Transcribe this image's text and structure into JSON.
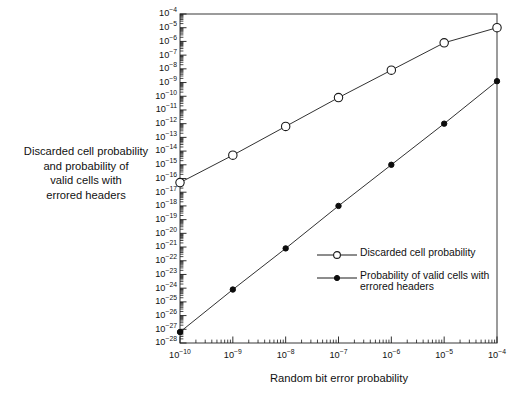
{
  "figure": {
    "background": "#ffffff",
    "frame_color": "#4a4a4a",
    "line_color": "#1a1a1a"
  },
  "y_axis": {
    "title_lines": [
      "Discarded cell probability",
      "and probability of",
      "valid cells with",
      "errored headers"
    ],
    "tick_mantissa": "10",
    "tick_exponents": [
      "-4",
      "-5",
      "-6",
      "-7",
      "-8",
      "-9",
      "-10",
      "-11",
      "-12",
      "-13",
      "-14",
      "-15",
      "-16",
      "-17",
      "-18",
      "-19",
      "-20",
      "-21",
      "-22",
      "-23",
      "-24",
      "-25",
      "-26",
      "-27",
      "-28"
    ]
  },
  "x_axis": {
    "title": "Random bit error probability",
    "tick_mantissa": "10",
    "tick_exponents": [
      "-10",
      "-9",
      "-8",
      "-7",
      "-6",
      "-5",
      "-4"
    ]
  },
  "legend": {
    "entries": [
      {
        "marker": "open-circle",
        "label": "Discarded cell probability"
      },
      {
        "marker": "filled-circle",
        "label": "Probability of valid cells with errored headers"
      }
    ]
  },
  "chart_data": {
    "type": "line",
    "title": "",
    "xlabel": "Random bit error probability",
    "ylabel": "Discarded cell probability and probability of valid cells with errored headers",
    "xscale": "log",
    "yscale": "log",
    "xlim": [
      1e-10,
      0.0001
    ],
    "ylim": [
      1e-28,
      0.0001
    ],
    "xticks": [
      1e-10,
      1e-09,
      1e-08,
      1e-07,
      1e-06,
      1e-05,
      0.0001
    ],
    "grid": false,
    "legend_position": "inside-lower-right",
    "x": [
      1e-10,
      1e-09,
      1e-08,
      1e-07,
      1e-06,
      1e-05,
      0.0001
    ],
    "series": [
      {
        "name": "Discarded cell probability",
        "marker": "open-circle",
        "x_exponents": [
          -10,
          -9,
          -8,
          -7,
          -6,
          -5,
          -4
        ],
        "y_exponents": [
          -16.3,
          -14.3,
          -12.2,
          -10.1,
          -8.1,
          -6.1,
          -5.0
        ],
        "values": [
          5e-17,
          5e-15,
          6e-13,
          8e-11,
          8e-09,
          8e-07,
          1e-05
        ]
      },
      {
        "name": "Probability of valid cells with errored headers",
        "marker": "filled-circle",
        "x_exponents": [
          -10,
          -9,
          -8,
          -7,
          -6,
          -5,
          -4
        ],
        "y_exponents": [
          -27.2,
          -24.1,
          -21.1,
          -18.0,
          -15.0,
          -12.0,
          -8.9
        ],
        "values": [
          6e-28,
          8e-25,
          8e-22,
          1e-18,
          1e-15,
          1e-12,
          1.3e-09
        ]
      }
    ]
  }
}
